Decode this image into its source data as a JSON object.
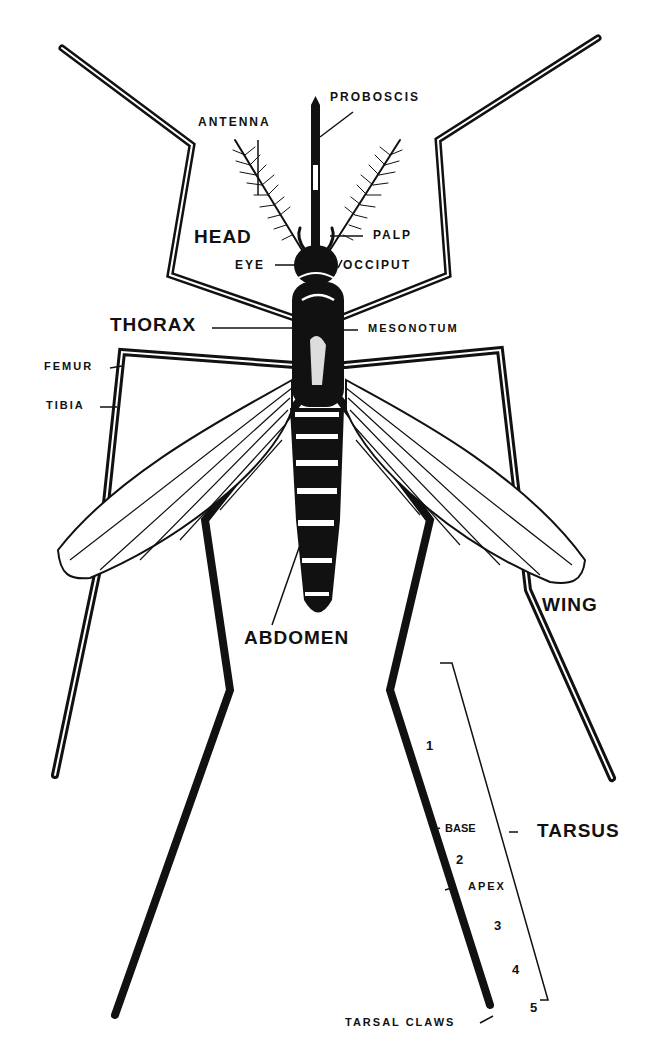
{
  "colors": {
    "ink": "#111111",
    "paper": "#ffffff"
  },
  "labels": {
    "proboscis": "PROBOSCIS",
    "antenna": "ANTENNA",
    "head": "HEAD",
    "palp": "PALP",
    "eye": "EYE",
    "occiput": "OCCIPUT",
    "thorax": "THORAX",
    "mesonotum": "MESONOTUM",
    "femur": "FEMUR",
    "tibia": "TIBIA",
    "wing": "WING",
    "abdomen": "ABDOMEN",
    "tarsus": "TARSUS",
    "base": "BASE",
    "apex": "APEX",
    "tarsal_claws": "TARSAL CLAWS",
    "segments": [
      "1",
      "2",
      "3",
      "4",
      "5"
    ]
  }
}
